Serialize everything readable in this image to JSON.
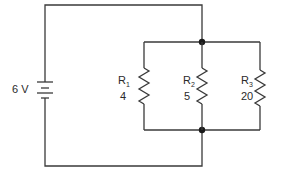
{
  "circuit": {
    "source": {
      "label": "6 V",
      "value": 6,
      "unit": "V"
    },
    "resistors": [
      {
        "name": "R",
        "sub": "1",
        "value": "4"
      },
      {
        "name": "R",
        "sub": "2",
        "value": "5"
      },
      {
        "name": "R",
        "sub": "3",
        "value": "20"
      }
    ],
    "configuration": "parallel",
    "colors": {
      "wire": "#3a3a3a",
      "background": "#ffffff"
    }
  }
}
